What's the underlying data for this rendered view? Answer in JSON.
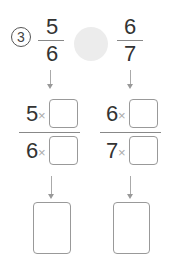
{
  "problem": {
    "number_label": "3",
    "left_fraction": {
      "numerator": "5",
      "denominator": "6"
    },
    "right_fraction": {
      "numerator": "6",
      "denominator": "7"
    },
    "compare_blank": ""
  },
  "step1": {
    "left": {
      "numerator_prefix": "5",
      "denominator_prefix": "6",
      "operator": "×",
      "numerator_value": "",
      "denominator_value": ""
    },
    "right": {
      "numerator_prefix": "6",
      "denominator_prefix": "7",
      "operator": "×",
      "numerator_value": "",
      "denominator_value": ""
    }
  },
  "step2": {
    "left_answer": "",
    "right_answer": ""
  }
}
